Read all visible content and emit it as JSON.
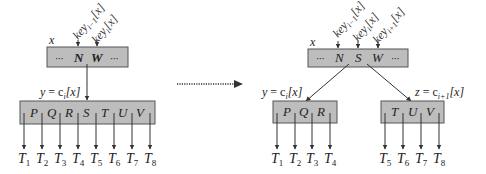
{
  "diagram": {
    "colors": {
      "node_fill": "#bdbdbd",
      "node_stroke": "#555555",
      "text": "#222222",
      "arrow": "#333333"
    },
    "transition_arrow": {
      "style": "dotted",
      "direction": "right"
    },
    "before": {
      "parent": {
        "name": "x",
        "keys": [
          "···",
          "N",
          "W",
          "···"
        ],
        "key_labels": [
          "key",
          "key"
        ],
        "key_label_subs": [
          "i−1",
          "i"
        ],
        "key_label_suffix": "[x]"
      },
      "child": {
        "label_var": "y",
        "label_eq": " = c",
        "label_sub": "i",
        "label_suffix": "[x]",
        "keys": [
          "P",
          "Q",
          "R",
          "S",
          "T",
          "U",
          "V"
        ]
      },
      "subtrees": [
        "T",
        "T",
        "T",
        "T",
        "T",
        "T",
        "T",
        "T"
      ],
      "subtree_subs": [
        "1",
        "2",
        "3",
        "4",
        "5",
        "6",
        "7",
        "8"
      ]
    },
    "after": {
      "parent": {
        "name": "x",
        "keys": [
          "···",
          "N",
          "S",
          "W",
          "···"
        ],
        "key_labels": [
          "key",
          "key",
          "key"
        ],
        "key_label_subs": [
          "i−1",
          "i",
          "i+1"
        ],
        "key_label_suffix": "[x]"
      },
      "left_child": {
        "label_var": "y",
        "label_eq": " = c",
        "label_sub": "i",
        "label_suffix": "[x]",
        "keys": [
          "P",
          "Q",
          "R"
        ],
        "subtrees": [
          "T",
          "T",
          "T",
          "T"
        ],
        "subtree_subs": [
          "1",
          "2",
          "3",
          "4"
        ]
      },
      "right_child": {
        "label_var": "z",
        "label_eq": " = c",
        "label_sub": "i+1",
        "label_suffix": "[x]",
        "keys": [
          "T",
          "U",
          "V"
        ],
        "subtrees": [
          "T",
          "T",
          "T",
          "T"
        ],
        "subtree_subs": [
          "5",
          "6",
          "7",
          "8"
        ]
      }
    }
  }
}
